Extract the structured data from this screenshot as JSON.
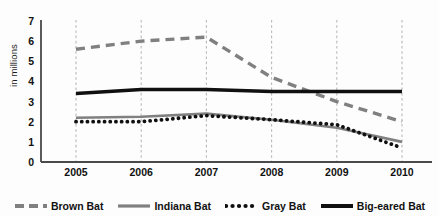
{
  "chart_data": {
    "type": "line",
    "title": "",
    "xlabel": "",
    "ylabel": "in millions",
    "categories": [
      "2005",
      "2006",
      "2007",
      "2008",
      "2009",
      "2010"
    ],
    "x": [
      2005,
      2006,
      2007,
      2008,
      2009,
      2010
    ],
    "ylim": [
      0,
      7
    ],
    "yticks": [
      "0",
      "1",
      "2",
      "3",
      "4",
      "5",
      "6",
      "7"
    ],
    "grid": "vertical-dashed",
    "legend_position": "bottom",
    "series": [
      {
        "name": "Brown Bat",
        "values": [
          5.6,
          6.0,
          6.2,
          4.2,
          3.0,
          2.0
        ],
        "color": "#808080",
        "style": "dashed",
        "width": 3.4
      },
      {
        "name": "Indiana Bat",
        "values": [
          2.2,
          2.25,
          2.4,
          2.1,
          1.7,
          1.0
        ],
        "color": "#808080",
        "style": "solid",
        "width": 2.6
      },
      {
        "name": "Gray Bat",
        "values": [
          2.0,
          2.0,
          2.3,
          2.1,
          1.85,
          0.7
        ],
        "color": "#101010",
        "style": "dotted",
        "width": 3.4
      },
      {
        "name": "Big-eared Bat",
        "values": [
          3.4,
          3.6,
          3.6,
          3.5,
          3.5,
          3.5
        ],
        "color": "#101010",
        "style": "solid",
        "width": 3.4
      }
    ]
  },
  "axis": {
    "y_label": "in millions",
    "y_ticks": [
      "7",
      "6",
      "5",
      "4",
      "3",
      "2",
      "1",
      "0"
    ],
    "x_ticks": [
      "2005",
      "2006",
      "2007",
      "2008",
      "2009",
      "2010"
    ]
  },
  "legend": {
    "items": [
      {
        "label": "Brown Bat"
      },
      {
        "label": "Indiana Bat"
      },
      {
        "label": "Gray Bat"
      },
      {
        "label": "Big-eared Bat"
      }
    ]
  }
}
